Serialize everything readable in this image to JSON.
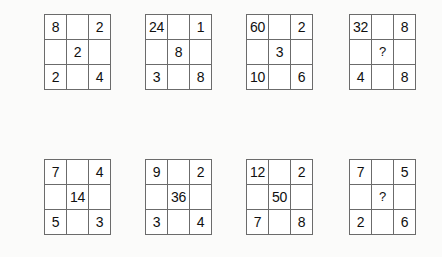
{
  "page": {
    "background_color": "#fbfbfa",
    "grid_line_color": "#6b6b6b",
    "cell_background": "#ffffff",
    "text_color": "#101010"
  },
  "rows": [
    {
      "name": "top-row",
      "grids": [
        {
          "name": "grid-1",
          "cells": [
            [
              "8",
              "",
              "2"
            ],
            [
              "",
              "2",
              ""
            ],
            [
              "2",
              "",
              "4"
            ]
          ]
        },
        {
          "name": "grid-2",
          "cells": [
            [
              "24",
              "",
              "1"
            ],
            [
              "",
              "8",
              ""
            ],
            [
              "3",
              "",
              "8"
            ]
          ]
        },
        {
          "name": "grid-3",
          "cells": [
            [
              "60",
              "",
              "2"
            ],
            [
              "",
              "3",
              ""
            ],
            [
              "10",
              "",
              "6"
            ]
          ]
        },
        {
          "name": "grid-4",
          "cells": [
            [
              "32",
              "",
              "8"
            ],
            [
              "",
              "?",
              ""
            ],
            [
              "4",
              "",
              "8"
            ]
          ]
        }
      ]
    },
    {
      "name": "bottom-row",
      "grids": [
        {
          "name": "grid-5",
          "cells": [
            [
              "7",
              "",
              "4"
            ],
            [
              "",
              "14",
              ""
            ],
            [
              "5",
              "",
              "3"
            ]
          ]
        },
        {
          "name": "grid-6",
          "cells": [
            [
              "9",
              "",
              "2"
            ],
            [
              "",
              "36",
              ""
            ],
            [
              "3",
              "",
              "4"
            ]
          ]
        },
        {
          "name": "grid-7",
          "cells": [
            [
              "12",
              "",
              "2"
            ],
            [
              "",
              "50",
              ""
            ],
            [
              "7",
              "",
              "8"
            ]
          ]
        },
        {
          "name": "grid-8",
          "cells": [
            [
              "7",
              "",
              "5"
            ],
            [
              "",
              "?",
              ""
            ],
            [
              "2",
              "",
              "6"
            ]
          ]
        }
      ]
    }
  ]
}
